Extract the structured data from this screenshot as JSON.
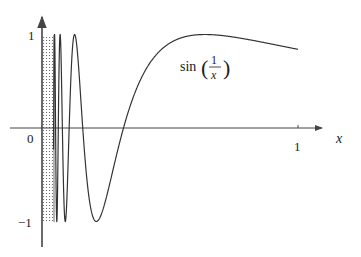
{
  "chart_data": {
    "type": "line",
    "title": "",
    "function_label": "sin(1/x)",
    "function_label_parts": {
      "fn": "sin",
      "numerator": "1",
      "denominator": "x"
    },
    "xlabel": "x",
    "ylabel": "",
    "xlim": [
      0,
      1.1
    ],
    "ylim": [
      -1.1,
      1.1
    ],
    "x_ticks": [
      {
        "value": 0,
        "label": "0"
      },
      {
        "value": 1,
        "label": "1"
      }
    ],
    "y_ticks": [
      {
        "value": 1,
        "label": "1"
      },
      {
        "value": -1,
        "label": "−1"
      }
    ],
    "grid": false,
    "legend": "none",
    "series": [
      {
        "name": "sin(1/x)",
        "x_range": [
          0.045,
          1.0
        ],
        "sample_points": [
          {
            "x": 0.1061,
            "y": 1
          },
          {
            "x": 0.2122,
            "y": -1
          },
          {
            "x": 0.3183,
            "y": 0
          },
          {
            "x": 0.6366,
            "y": 1
          },
          {
            "x": 1.0,
            "y": 0.841
          }
        ]
      }
    ],
    "annotations": [
      {
        "type": "dotted-band",
        "x_range": [
          0,
          0.047
        ],
        "y_range": [
          -1,
          1
        ],
        "meaning": "infinitely dense oscillation near 0"
      }
    ],
    "colors": {
      "curve": "#333333",
      "axes": "#444444",
      "dots": "#555555"
    }
  }
}
